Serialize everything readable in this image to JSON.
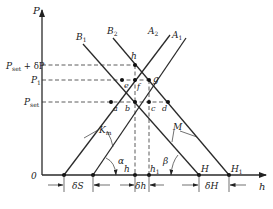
{
  "diagram": {
    "axes": {
      "y_label": "P",
      "x_label": "h",
      "origin_label": "0"
    },
    "y_levels": [
      {
        "id": "pset_dp",
        "main": "P",
        "sub": "set",
        "suffix": " + δP"
      },
      {
        "id": "p1",
        "main": "P",
        "sub": "1",
        "suffix": ""
      },
      {
        "id": "pset",
        "main": "P",
        "sub": "set",
        "suffix": ""
      }
    ],
    "lines": [
      {
        "id": "B1",
        "main": "B",
        "sub": "1"
      },
      {
        "id": "B2",
        "main": "B",
        "sub": "2"
      },
      {
        "id": "A2",
        "main": "A",
        "sub": "2"
      },
      {
        "id": "A1",
        "main": "A",
        "sub": "1"
      }
    ],
    "points": {
      "a": "a",
      "b": "b",
      "c": "c",
      "d": "d",
      "e": "e",
      "f": "f",
      "g": "g",
      "h": "h"
    },
    "x_points": {
      "h": {
        "main": "h",
        "sub": ""
      },
      "h1": {
        "main": "h",
        "sub": "1"
      },
      "H": {
        "main": "H",
        "sub": ""
      },
      "H1": {
        "main": "H",
        "sub": "1"
      }
    },
    "annotations": {
      "Km": {
        "main": "K",
        "sub": "m"
      },
      "M": "M",
      "alpha": "α",
      "beta": "β"
    },
    "dimensions": {
      "dS": "δS",
      "dh": "δh",
      "dH": "δH"
    }
  }
}
